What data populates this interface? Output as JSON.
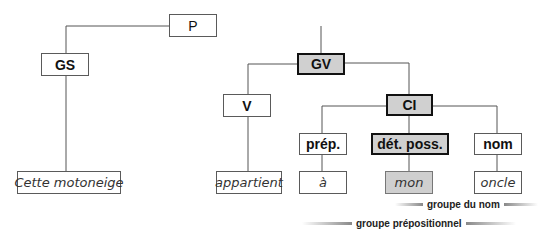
{
  "diagram": {
    "type": "syntax-tree",
    "nodes": {
      "p": "P",
      "gs": "GS",
      "gv": "GV",
      "v": "V",
      "ci": "CI",
      "prep": "prép.",
      "det_poss": "dét. poss.",
      "nom": "nom"
    },
    "words": {
      "subject": "Cette motoneige",
      "verb": "appartient",
      "prep": "à",
      "det": "mon",
      "noun": "oncle"
    },
    "groups": {
      "noun_group": "groupe du nom",
      "prep_group": "groupe prépositionnel"
    },
    "colors": {
      "highlight_fill": "#d0d0d0",
      "line": "#555555"
    }
  }
}
